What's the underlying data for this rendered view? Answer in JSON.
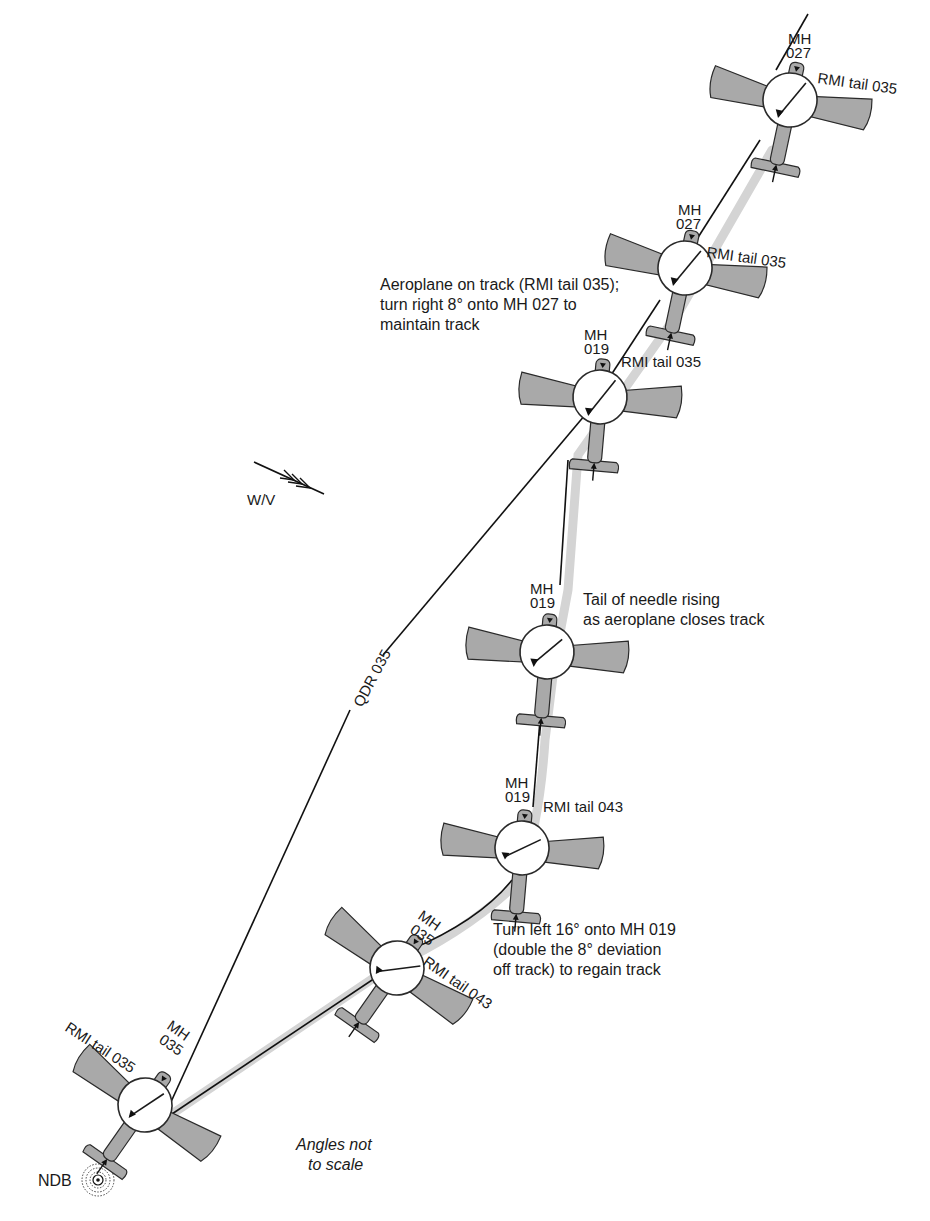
{
  "diagram": {
    "type": "NDB tracking outbound - wind correction",
    "track_label": "QDR 035",
    "wind_label": "W/V",
    "beacon_label": "NDB",
    "scale_note_line1": "Angles not",
    "scale_note_line2": "to scale",
    "aircraft": [
      {
        "id": 1,
        "mh_label": "MH",
        "mh_value": "035",
        "rmi_label": "RMI tail 035"
      },
      {
        "id": 2,
        "mh_label": "MH",
        "mh_value": "035",
        "rmi_label": "RMI tail 043"
      },
      {
        "id": 3,
        "mh_label": "MH",
        "mh_value": "019",
        "rmi_label": "RMI tail 043"
      },
      {
        "id": 4,
        "mh_label": "MH",
        "mh_value": "019",
        "rmi_label": ""
      },
      {
        "id": 5,
        "mh_label": "MH",
        "mh_value": "019",
        "rmi_label": "RMI tail 035"
      },
      {
        "id": 6,
        "mh_label": "MH",
        "mh_value": "027",
        "rmi_label": "RMI tail 035"
      },
      {
        "id": 7,
        "mh_label": "MH",
        "mh_value": "027",
        "rmi_label": "RMI tail 035"
      }
    ],
    "annotations": {
      "turn_left": [
        "Turn left 16° onto MH 019",
        "(double the 8° deviation",
        "off track) to regain track"
      ],
      "needle_rising": [
        "Tail of needle rising",
        "as aeroplane closes track"
      ],
      "on_track": [
        "Aeroplane on track (RMI tail 035);",
        "turn right 8° onto MH 027 to",
        "maintain track"
      ]
    },
    "colors": {
      "aircraft_fill": "#a9a9a9",
      "halo": "#d4d4d4",
      "line": "#111111",
      "background": "#ffffff"
    }
  }
}
